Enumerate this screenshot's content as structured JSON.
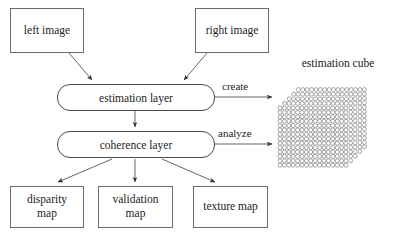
{
  "diagram": {
    "background_color": "#ffffff",
    "line_color": "#555555",
    "text_color": "#1c1c1c"
  },
  "inputs": [
    {
      "id": "left-image",
      "label": "left image"
    },
    {
      "id": "right-image",
      "label": "right image"
    }
  ],
  "layers": [
    {
      "id": "estimation-layer",
      "label": "estimation layer"
    },
    {
      "id": "coherence-layer",
      "label": "coherence layer"
    }
  ],
  "edge_labels": {
    "create": "create",
    "analyze": "analyze"
  },
  "cube": {
    "title": "estimation cube",
    "columns": 16,
    "rows": 14,
    "depth_slices": 5,
    "cell_color": "#ffffff",
    "stroke_color": "#808080"
  },
  "outputs": [
    {
      "id": "disparity-map",
      "label": "disparity\nmap"
    },
    {
      "id": "validation-map",
      "label": "validation\nmap"
    },
    {
      "id": "texture-map",
      "label": "texture map"
    }
  ]
}
